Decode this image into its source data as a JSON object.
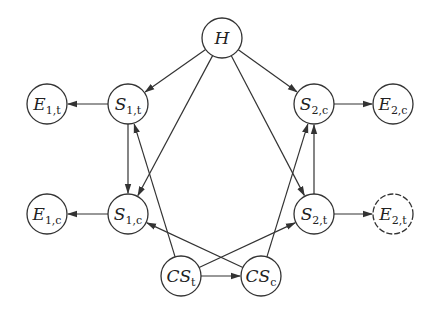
{
  "diagram": {
    "type": "directed-graph",
    "nodes": [
      {
        "id": "H",
        "label": "H",
        "sub": "",
        "x": 222,
        "y": 38,
        "r": 20,
        "dashed": false
      },
      {
        "id": "E1t",
        "label": "E",
        "sub": "1,t",
        "x": 47,
        "y": 104,
        "r": 20,
        "dashed": false
      },
      {
        "id": "S1t",
        "label": "S",
        "sub": "1,t",
        "x": 128,
        "y": 104,
        "r": 20,
        "dashed": false
      },
      {
        "id": "S2c",
        "label": "S",
        "sub": "2,c",
        "x": 314,
        "y": 104,
        "r": 20,
        "dashed": false
      },
      {
        "id": "E2c",
        "label": "E",
        "sub": "2,c",
        "x": 393,
        "y": 104,
        "r": 20,
        "dashed": false
      },
      {
        "id": "E1c",
        "label": "E",
        "sub": "1,c",
        "x": 47,
        "y": 214,
        "r": 20,
        "dashed": false
      },
      {
        "id": "S1c",
        "label": "S",
        "sub": "1,c",
        "x": 128,
        "y": 214,
        "r": 20,
        "dashed": false
      },
      {
        "id": "S2t",
        "label": "S",
        "sub": "2,t",
        "x": 314,
        "y": 214,
        "r": 20,
        "dashed": false
      },
      {
        "id": "E2t",
        "label": "E",
        "sub": "2,t",
        "x": 393,
        "y": 214,
        "r": 20,
        "dashed": true
      },
      {
        "id": "CSt",
        "label": "CS",
        "sub": "t",
        "x": 181,
        "y": 276,
        "r": 20,
        "dashed": false
      },
      {
        "id": "CSc",
        "label": "CS",
        "sub": "c",
        "x": 261,
        "y": 276,
        "r": 20,
        "dashed": false
      }
    ],
    "edges": [
      {
        "from": "H",
        "to": "S1t"
      },
      {
        "from": "H",
        "to": "S2c"
      },
      {
        "from": "H",
        "to": "S1c"
      },
      {
        "from": "H",
        "to": "S2t"
      },
      {
        "from": "S1t",
        "to": "E1t"
      },
      {
        "from": "S1t",
        "to": "S1c"
      },
      {
        "from": "S1c",
        "to": "E1c"
      },
      {
        "from": "S2c",
        "to": "E2c"
      },
      {
        "from": "S2t",
        "to": "S2c"
      },
      {
        "from": "S2t",
        "to": "E2t"
      },
      {
        "from": "CSt",
        "to": "S1t"
      },
      {
        "from": "CSt",
        "to": "S2t"
      },
      {
        "from": "CSt",
        "to": "CSc"
      },
      {
        "from": "CSc",
        "to": "S2c"
      },
      {
        "from": "CSc",
        "to": "S1c"
      }
    ]
  }
}
